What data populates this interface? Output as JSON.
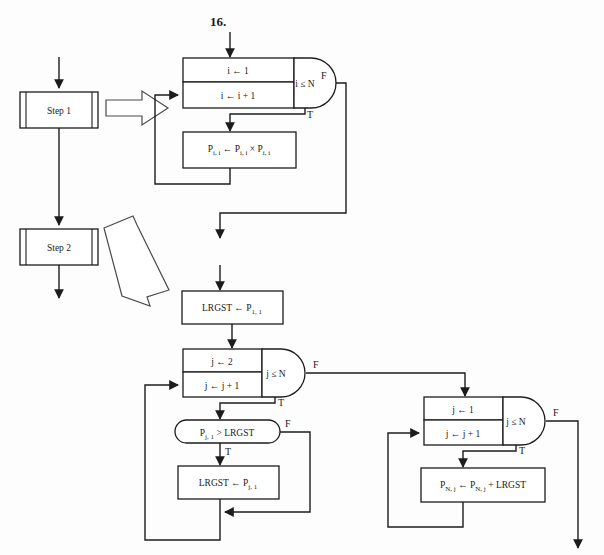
{
  "figure": {
    "number_label": "16.",
    "background_color": "#fdfdfd",
    "line_color": "#1c1c1c"
  },
  "overview": {
    "steps": [
      {
        "name": "step-1",
        "label": "Step 1"
      },
      {
        "name": "step-2",
        "label": "Step 2"
      }
    ]
  },
  "loops": {
    "loop1": {
      "init": "i ← 1",
      "increment": "i ← i + 1",
      "condition": "i ≤ N",
      "true_flag": "T",
      "false_flag": "F",
      "body": {
        "lhs": "P",
        "lhs_sub": "i, i",
        "assign": "←",
        "op1": "P",
        "op1_sub": "i, i",
        "operator": "×",
        "op2": "P",
        "op2_sub": "i, i",
        "full": "P i, i ← P i, i × P i, i"
      }
    },
    "loop2": {
      "init": "j ← 2",
      "increment": "j ← j + 1",
      "condition": "j ≤ N",
      "true_flag": "T",
      "false_flag": "F",
      "test": {
        "lhs": "P",
        "lhs_sub": "j, 1",
        "operator": ">",
        "rhs": "LRGST",
        "full": "P j, 1 > LRGST",
        "true_flag": "T",
        "false_flag": "F"
      },
      "body": {
        "lhs": "LRGST",
        "assign": "←",
        "rhs": "P",
        "rhs_sub": "j, 1",
        "full": "LRGST ← P j, 1"
      }
    },
    "loop3": {
      "init": "j ← 1",
      "increment": "j ← j + 1",
      "condition": "j ≤ N",
      "true_flag": "T",
      "false_flag": "F",
      "body": {
        "lhs": "P",
        "lhs_sub": "N, j",
        "assign": "←",
        "op1": "P",
        "op1_sub": "N, j",
        "operator": "+",
        "op2": "LRGST",
        "full": "P N, j ← P N, j + LRGST"
      }
    }
  },
  "statements": {
    "init_largest": {
      "lhs": "LRGST",
      "assign": "←",
      "rhs": "P",
      "rhs_sub": "1, 1",
      "full": "LRGST ← P 1, 1"
    }
  }
}
